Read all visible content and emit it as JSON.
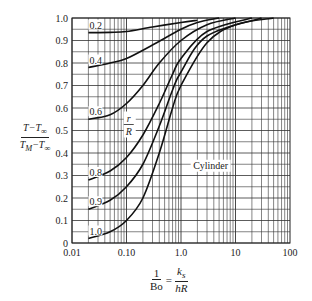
{
  "chart_data": {
    "type": "line",
    "title": "",
    "xlabel": "1/Bo = k_s / (hR)",
    "ylabel": "(T - T∞) / (T_M - T∞)",
    "xscale": "log",
    "xlim": [
      0.01,
      100
    ],
    "ylim": [
      0,
      1.0
    ],
    "grid": true,
    "x_ticks": [
      "0.01",
      "0.10",
      "1.0",
      "10",
      "100"
    ],
    "y_ticks": [
      "0",
      "0.1",
      "0.2",
      "0.3",
      "0.4",
      "0.5",
      "0.6",
      "0.7",
      "0.8",
      "0.9",
      "1.0"
    ],
    "legend": "curves labeled by r/R",
    "annotations": [
      "Cylinder",
      "r/R"
    ],
    "series": [
      {
        "name": "0.2",
        "x": [
          0.02,
          0.05,
          0.1,
          0.3,
          1.0,
          2.0
        ],
        "y": [
          0.935,
          0.936,
          0.94,
          0.96,
          0.98,
          0.99
        ]
      },
      {
        "name": "0.4",
        "x": [
          0.02,
          0.05,
          0.1,
          0.3,
          1.0,
          2.0,
          5.0
        ],
        "y": [
          0.78,
          0.8,
          0.82,
          0.88,
          0.95,
          0.98,
          1.0
        ]
      },
      {
        "name": "0.6",
        "x": [
          0.02,
          0.05,
          0.1,
          0.2,
          0.4,
          1.0,
          3.0,
          10.0
        ],
        "y": [
          0.55,
          0.57,
          0.62,
          0.7,
          0.8,
          0.9,
          0.97,
          1.0
        ]
      },
      {
        "name": "0.8",
        "x": [
          0.02,
          0.05,
          0.1,
          0.2,
          0.4,
          0.7,
          1.0,
          3.0,
          20.0
        ],
        "y": [
          0.28,
          0.32,
          0.38,
          0.48,
          0.62,
          0.75,
          0.82,
          0.94,
          1.0
        ]
      },
      {
        "name": "0.9",
        "x": [
          0.02,
          0.05,
          0.1,
          0.2,
          0.4,
          0.7,
          1.0,
          3.0,
          30.0
        ],
        "y": [
          0.15,
          0.19,
          0.25,
          0.35,
          0.52,
          0.68,
          0.76,
          0.92,
          1.0
        ]
      },
      {
        "name": "1.0",
        "x": [
          0.02,
          0.05,
          0.1,
          0.2,
          0.4,
          0.7,
          1.0,
          3.0,
          10.0,
          50.0
        ],
        "y": [
          0.02,
          0.05,
          0.1,
          0.2,
          0.4,
          0.6,
          0.7,
          0.89,
          0.97,
          1.0
        ]
      }
    ]
  },
  "labels": {
    "y_num": "T−T∞",
    "y_den": "T_M−T∞",
    "x_one": "1",
    "x_bo": "Bo",
    "x_eq": "=",
    "x_ks": "k_s",
    "x_hr": "hR",
    "cylinder": "Cylinder",
    "r": "r",
    "R": "R"
  }
}
